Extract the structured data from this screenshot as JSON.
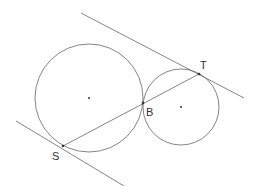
{
  "diagram": {
    "colors": {
      "stroke": "#666666",
      "point": "#333333",
      "label": "#333333",
      "background": "#ffffff"
    },
    "circles": [
      {
        "name": "large-circle",
        "cx": 89,
        "cy": 98,
        "r": 54
      },
      {
        "name": "small-circle",
        "cx": 181,
        "cy": 107,
        "r": 38
      }
    ],
    "lines": [
      {
        "name": "upper-tangent-line",
        "x1": 81,
        "y1": 13,
        "x2": 244,
        "y2": 98
      },
      {
        "name": "lower-tangent-line",
        "x1": 16,
        "y1": 121,
        "x2": 124,
        "y2": 186
      },
      {
        "name": "segment-ST",
        "x1": 63,
        "y1": 146,
        "x2": 199,
        "y2": 74
      }
    ],
    "points": [
      {
        "name": "point-S",
        "label": "S",
        "x": 63,
        "y": 146,
        "lx": 52,
        "ly": 160
      },
      {
        "name": "point-B",
        "label": "B",
        "x": 143,
        "y": 103,
        "lx": 146,
        "ly": 116
      },
      {
        "name": "point-T",
        "label": "T",
        "x": 199,
        "y": 74,
        "lx": 200,
        "ly": 69
      }
    ],
    "centers": [
      {
        "name": "large-circle-center",
        "x": 89,
        "y": 98
      },
      {
        "name": "small-circle-center",
        "x": 181,
        "y": 107
      }
    ]
  }
}
